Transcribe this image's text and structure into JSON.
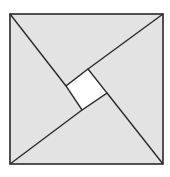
{
  "diagram": {
    "title": "",
    "colors": {
      "background": "#ffffff",
      "triangle_fill": "#e3e3e3",
      "inner_square_fill": "#ffffff",
      "stroke": "#2a2a2a"
    },
    "outer_square": {
      "x1": 10,
      "y1": 14,
      "x2": 163,
      "y2": 164
    },
    "inner_square": {
      "top": [
        88,
        69
      ],
      "right": [
        107,
        93
      ],
      "bottom": [
        82,
        110
      ],
      "left": [
        66,
        86
      ]
    },
    "shapes": [
      {
        "name": "top-triangle",
        "points": "10,14 163,14 88,69 66,86"
      },
      {
        "name": "right-triangle",
        "points": "163,14 163,164 107,93 88,69"
      },
      {
        "name": "bottom-triangle",
        "points": "163,164 10,164 82,110 107,93"
      },
      {
        "name": "left-triangle",
        "points": "10,164 10,14 66,86 82,110"
      }
    ],
    "labels": []
  }
}
